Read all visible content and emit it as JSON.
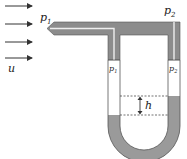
{
  "diagram": {
    "labels": {
      "flow_velocity": "u",
      "stagnation_pressure": "p",
      "stagnation_sub": "1",
      "static_pressure": "p",
      "static_sub": "2",
      "left_leg_pressure": "p",
      "left_leg_sub": "1",
      "right_leg_pressure": "p",
      "right_leg_sub": "2",
      "height_difference": "h"
    },
    "flow_arrows": 4,
    "colors": {
      "tube_fill": "#8c8c8c",
      "tube_edge": "#555555",
      "fluid": "#9a9a9a",
      "line": "#333333",
      "background": "#ffffff"
    }
  }
}
